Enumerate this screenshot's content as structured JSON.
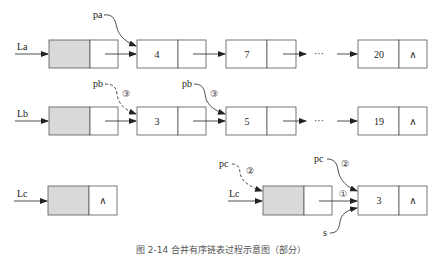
{
  "lists": {
    "La": {
      "label": "La",
      "pointer": "pa",
      "head_next": "",
      "nodes": [
        {
          "value": "4"
        },
        {
          "value": "7"
        },
        {
          "value": "20",
          "next": "∧"
        }
      ],
      "ellipsis": "···"
    },
    "Lb": {
      "label": "Lb",
      "pointers": [
        "pb",
        "pb"
      ],
      "step_marks": [
        "③",
        "③"
      ],
      "nodes": [
        {
          "value": "3"
        },
        {
          "value": "5"
        },
        {
          "value": "19",
          "next": "∧"
        }
      ],
      "ellipsis": "···"
    },
    "Lc_initial": {
      "label": "Lc",
      "head_next": "∧"
    },
    "Lc_after": {
      "label": "Lc",
      "pointers": [
        "pc",
        "pc",
        "s"
      ],
      "step_marks": [
        "②",
        "②",
        "①"
      ],
      "nodes": [
        {
          "value": "3",
          "next": "∧"
        }
      ]
    }
  },
  "caption": "图 2-14 合并有序链表过程示意图（部分）",
  "colors": {
    "head_fill": "#d9d9d9",
    "stroke": "#555555"
  }
}
